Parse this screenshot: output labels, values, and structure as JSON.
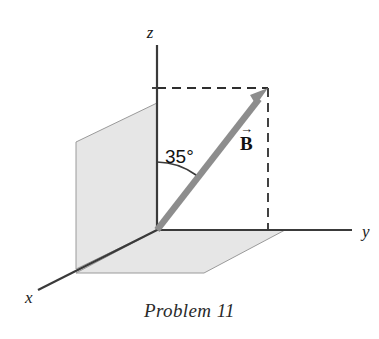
{
  "figure": {
    "caption": "Problem 11",
    "background_color": "#ffffff",
    "width": 379,
    "height": 339
  },
  "axes": {
    "x_label": "x",
    "y_label": "y",
    "z_label": "z",
    "axis_color": "#3a3a3a",
    "origin": {
      "x": 157,
      "y": 230
    },
    "x_end": {
      "x": 38,
      "y": 290
    },
    "y_end": {
      "x": 352,
      "y": 230
    },
    "z_end": {
      "x": 157,
      "y": 45
    }
  },
  "planes": {
    "vertical_plane_name": "xz-plane",
    "horizontal_plane_name": "xy-plane",
    "fill_color": "#e6e6e6",
    "edge_color": "#9a9a9a"
  },
  "vector": {
    "label": "B",
    "arrow_accent": "→",
    "color": "#8d8d8d",
    "tail": {
      "x": 157,
      "y": 230
    },
    "tip": {
      "x": 268,
      "y": 88
    }
  },
  "angle": {
    "value": "35°",
    "degrees": 35,
    "measured_from": "z-axis",
    "arc_color": "#3a3a3a"
  },
  "guides": {
    "dash_color": "#2e2e2e",
    "horizontal_dash_y": 88,
    "vertical_dash_x": 268
  }
}
